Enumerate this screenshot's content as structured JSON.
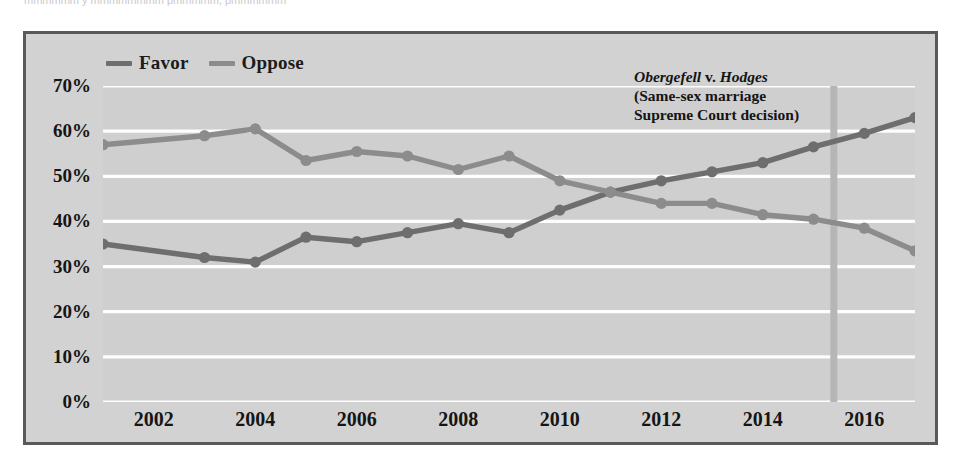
{
  "cropped_caption": "mmmmmm y mmmmmmmm pmmmmm, pmmmmmm",
  "legend": {
    "position": "top-left",
    "items": [
      {
        "label": "Favor",
        "color": "#6e6e6e",
        "icon": "line-swatch"
      },
      {
        "label": "Oppose",
        "color": "#8c8c8c",
        "icon": "line-swatch"
      }
    ]
  },
  "annotation": {
    "line1_italic_a": "Obergefell",
    "line1_roman": " v. ",
    "line1_italic_b": "Hodges",
    "line2": "(Same-sex marriage",
    "line3": "Supreme Court decision)",
    "marker_year": 2015.4,
    "marker_color": "#b6b6b6"
  },
  "colors": {
    "frame_border": "#595959",
    "figure_background": "#d2d2d2",
    "plot_background": "#cfcfcf",
    "gridline": "#fdfdfd",
    "favor": "#6e6e6e",
    "oppose": "#8c8c8c",
    "text": "#151515"
  },
  "chart_data": {
    "type": "line",
    "title": "",
    "subtitle": "",
    "xlabel": "",
    "ylabel": "",
    "xlim": [
      2001,
      2017
    ],
    "ylim": [
      0,
      70
    ],
    "ytick_values": [
      0,
      10,
      20,
      30,
      40,
      50,
      60,
      70
    ],
    "ytick_labels": [
      "0%",
      "10%",
      "20%",
      "30%",
      "40%",
      "50%",
      "60%",
      "70%"
    ],
    "xtick_values": [
      2002,
      2004,
      2006,
      2008,
      2010,
      2012,
      2014,
      2016
    ],
    "xtick_labels": [
      "2002",
      "2004",
      "2006",
      "2008",
      "2010",
      "2012",
      "2014",
      "2016"
    ],
    "grid": "horizontal",
    "legend_position": "above-plot-left",
    "x": [
      2001,
      2003,
      2004,
      2005,
      2006,
      2007,
      2008,
      2009,
      2010,
      2011,
      2012,
      2013,
      2014,
      2015,
      2016,
      2017
    ],
    "series": [
      {
        "name": "Favor",
        "color": "#6e6e6e",
        "values": [
          35,
          32,
          31,
          36.5,
          35.5,
          37.5,
          39.5,
          37.5,
          42.5,
          46.5,
          49,
          51,
          53,
          56.5,
          59.5,
          63
        ]
      },
      {
        "name": "Oppose",
        "color": "#8c8c8c",
        "values": [
          57,
          59,
          60.5,
          53.5,
          55.5,
          54.5,
          51.5,
          54.5,
          49,
          46.5,
          44,
          44,
          41.5,
          40.5,
          38.5,
          33.5
        ]
      }
    ],
    "annotations": [
      {
        "text": "Obergefell v. Hodges (Same-sex marriage Supreme Court decision)",
        "x": 2015.4,
        "type": "vertical-rule-with-label"
      }
    ]
  }
}
